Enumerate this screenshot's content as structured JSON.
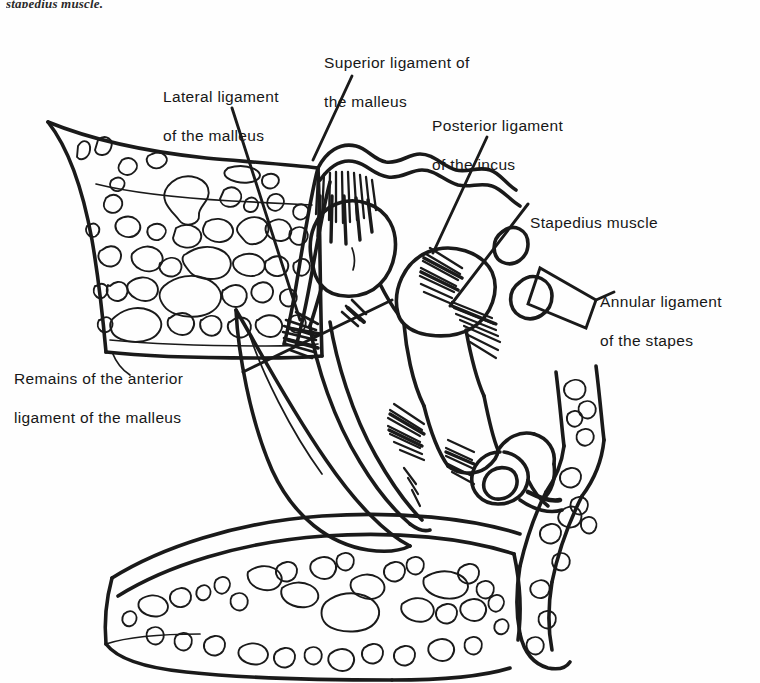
{
  "figure": {
    "domain": "anatomical-line-drawing",
    "cut_off_caption": "stapedius muscle.",
    "ink_color": "#1a1a1a",
    "background_color": "#ffffff"
  },
  "labels": [
    {
      "id": "lateral",
      "name": "lateral-ligament-of-the-malleus",
      "lines": [
        "Lateral ligament",
        "of the malleus"
      ],
      "text": "Lateral ligament of the malleus",
      "x": 163,
      "y": 67
    },
    {
      "id": "superior",
      "name": "superior-ligament-of-the-malleus",
      "lines": [
        "Superior ligament of",
        "the malleus"
      ],
      "text": "Superior ligament of the malleus",
      "x": 324,
      "y": 33
    },
    {
      "id": "posterior",
      "name": "posterior-ligament-of-the-incus",
      "lines": [
        "Posterior ligament",
        "of the incus"
      ],
      "text": "Posterior ligament of the incus",
      "x": 432,
      "y": 96
    },
    {
      "id": "stapedius",
      "name": "stapedius-muscle",
      "lines": [
        "Stapedius muscle"
      ],
      "text": "Stapedius muscle",
      "x": 530,
      "y": 193
    },
    {
      "id": "annular",
      "name": "annular-ligament-of-the-stapes",
      "lines": [
        "Annular ligament",
        "of the stapes"
      ],
      "text": "Annular ligament of the stapes",
      "x": 600,
      "y": 272
    },
    {
      "id": "anterior",
      "name": "remains-of-the-anterior-ligament-of-the-malleus",
      "lines": [
        "Remains of the anterior",
        "ligament of the malleus"
      ],
      "text": "Remains of the anterior ligament of the malleus",
      "x": 14,
      "y": 349
    }
  ],
  "leader_lines": [
    {
      "name": "leader-lateral-ligament",
      "from": [
        232,
        108
      ],
      "to": [
        300,
        320
      ]
    },
    {
      "name": "leader-superior-ligament",
      "from": [
        352,
        76
      ],
      "to": [
        312,
        158
      ]
    },
    {
      "name": "leader-posterior-ligament",
      "from": [
        487,
        137
      ],
      "to": [
        433,
        253
      ]
    },
    {
      "name": "leader-stapedius-muscle",
      "from": [
        528,
        204
      ],
      "to": [
        452,
        304
      ]
    },
    {
      "name": "leader-annular-bracket",
      "from": [
        598,
        300
      ],
      "to": [
        540,
        268
      ]
    },
    {
      "name": "leader-anterior-ligament",
      "from": [
        243,
        372
      ],
      "to": [
        390,
        300
      ]
    }
  ],
  "structures": [
    {
      "name": "superior-temporal-bone-trabecular",
      "description": "Upper cancellous bone block with trabecular spaces"
    },
    {
      "name": "inferior-temporal-bone-trabecular",
      "description": "Lower cancellous bone block with trabecular spaces"
    },
    {
      "name": "lateral-bone-trabecular",
      "description": "Right lateral bone strip with trabecular spaces"
    },
    {
      "name": "epitympanum-roof",
      "description": "Undulating roof of the attic / tegmen"
    },
    {
      "name": "malleus-head",
      "description": "Rounded head of the malleus"
    },
    {
      "name": "malleus-handle",
      "description": "Manubrium running down to the umbo"
    },
    {
      "name": "incus-body",
      "description": "Body and short process of the incus"
    },
    {
      "name": "incus-long-process",
      "description": "Long process descending to the lenticular process"
    },
    {
      "name": "stapes",
      "description": "Stapes with head, crura and footplate"
    },
    {
      "name": "stapes-footplate",
      "description": "Footplate seated in the oval window"
    },
    {
      "name": "tympanic-membrane",
      "description": "Eardrum sloping from the lateral wall to the umbo"
    },
    {
      "name": "ligament-fiber-burst-superior",
      "description": "Dense fibre spray of the superior malleal ligament"
    },
    {
      "name": "ligament-fiber-burst-lateral",
      "description": "Fibre spray of the lateral malleal ligament"
    },
    {
      "name": "ligament-fiber-burst-posterior",
      "description": "Fibre spray of the posterior incudal ligament"
    },
    {
      "name": "ligament-fiber-burst-umbo",
      "description": "Fibre spray at the umbo attachment"
    },
    {
      "name": "stapedius-tendon",
      "description": "Tendon of the stapedius reaching the stapes neck"
    }
  ]
}
